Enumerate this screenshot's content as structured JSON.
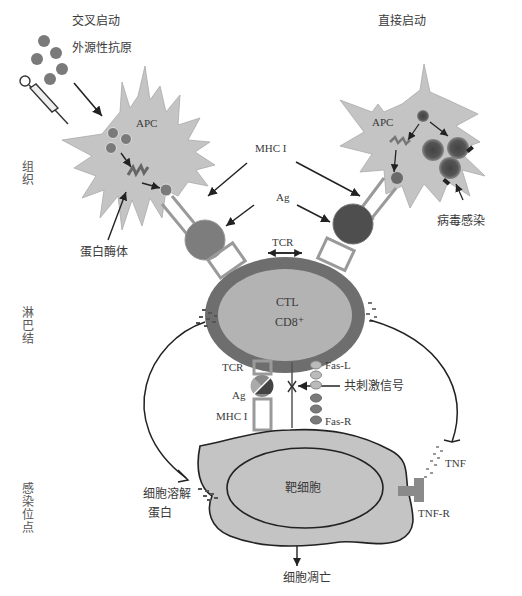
{
  "diagram": {
    "type": "biology-pathway",
    "headers": {
      "cross_priming": "交叉启动",
      "direct_priming": "直接启动"
    },
    "side_labels": {
      "tissue": "组织",
      "lymph_node": "淋巴结",
      "infection_site": "感染位点"
    },
    "left_apc": {
      "label": "APC",
      "antigen_label": "外源性抗原",
      "proteasome_label": "蛋白酶体"
    },
    "right_apc": {
      "label": "APC",
      "virus_label": "病毒感染"
    },
    "center": {
      "mhc_label": "MHC I",
      "ag_label": "Ag",
      "tcr_top_label": "TCR"
    },
    "ctl": {
      "line1": "CTL",
      "line2": "CD8⁺"
    },
    "synapse": {
      "tcr_label": "TCR",
      "ag_label": "Ag",
      "mhc_label": "MHC I",
      "fas_l_label": "Fas-L",
      "fas_r_label": "Fas-R",
      "costim_label": "共刺激信号"
    },
    "target": {
      "label": "靶细胞",
      "perforin_label_line1": "细胞溶解",
      "perforin_label_line2": "蛋白",
      "tnf_label": "TNF",
      "tnfr_label": "TNF-R",
      "apoptosis_label": "细胞凋亡"
    },
    "colors": {
      "cell_fill": "#c4c4c4",
      "ctl_rim": "#6e6e6e",
      "ctl_inner": "#b0b0b0",
      "antigen": "#7a7a7a",
      "dark_antigen": "#4a4a4a",
      "line": "#222222",
      "receptor_outline": "#9a9a9a"
    }
  }
}
